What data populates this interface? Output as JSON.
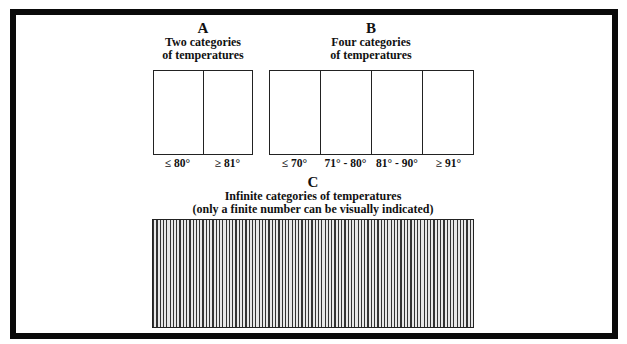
{
  "panels": {
    "A": {
      "letter": "A",
      "line1": "Two categories",
      "line2": "of temperatures",
      "labels": [
        "≤ 80°",
        "≥ 81°"
      ]
    },
    "B": {
      "letter": "B",
      "line1": "Four categories",
      "line2": "of temperatures",
      "labels": [
        "≤ 70°",
        "71° - 80°",
        "81° - 90°",
        "≥ 91°"
      ]
    },
    "C": {
      "letter": "C",
      "line1": "Infinite categories of temperatures",
      "line2": "(only a finite number can be visually indicated)"
    }
  }
}
